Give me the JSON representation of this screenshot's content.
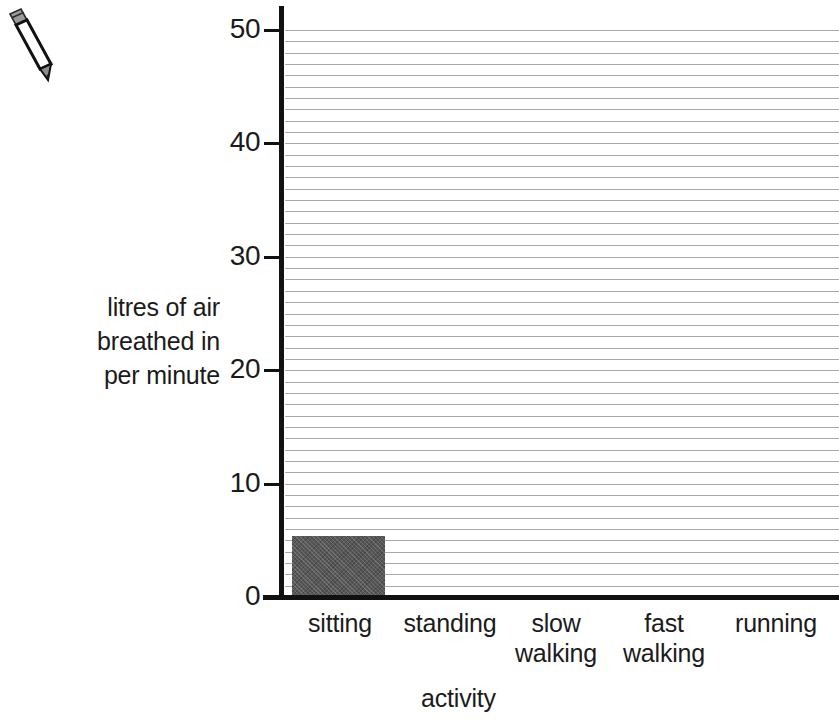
{
  "decorations": {
    "pencil_icon": "pencil-icon"
  },
  "chart_data": {
    "type": "bar",
    "title": "",
    "xlabel": "activity",
    "ylabel": "litres of air\nbreathed in\nper minute",
    "categories": [
      "sitting",
      "standing",
      "slow\nwalking",
      "fast\nwalking",
      "running"
    ],
    "values": [
      5,
      null,
      null,
      null,
      null
    ],
    "ylim": [
      0,
      50
    ],
    "ytick_labels": [
      "50",
      "40",
      "30",
      "20",
      "10",
      "0"
    ],
    "ytick_values": [
      50,
      40,
      30,
      20,
      10,
      0
    ],
    "minor_gridline_step": 1,
    "grid": true,
    "grid_color": "#a9a9a9",
    "bar_color": "#575757",
    "axis_color": "#111111",
    "legend": null
  }
}
